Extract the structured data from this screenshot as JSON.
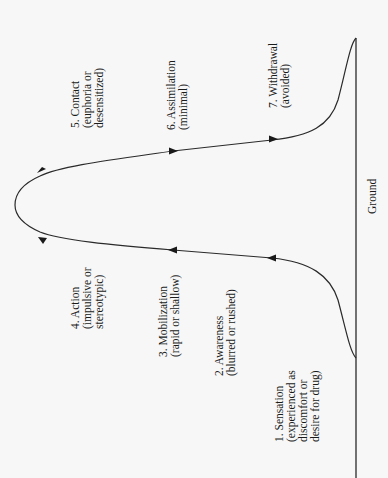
{
  "diagram": {
    "title": "",
    "ground_label": "Ground",
    "stages": [
      {
        "id": 1,
        "lines": [
          "1. Sensation",
          "(experienced as",
          "discomfort or",
          "desire for drug)"
        ]
      },
      {
        "id": 2,
        "lines": [
          "2. Awareness",
          "(blurred or rushed)"
        ]
      },
      {
        "id": 3,
        "lines": [
          "3. Mobilization",
          "(rapid or shallow)"
        ]
      },
      {
        "id": 4,
        "lines": [
          "4. Action",
          "(impulsive or",
          "stereotypic)"
        ]
      },
      {
        "id": 5,
        "lines": [
          "5. Contact",
          "(euphoria or",
          "desensitized)"
        ]
      },
      {
        "id": 6,
        "lines": [
          "6. Assimilation",
          "(minimal)"
        ]
      },
      {
        "id": 7,
        "lines": [
          "7. Withdrawal",
          "(avoided)"
        ]
      }
    ],
    "colors": {
      "background": "#f7f7f7",
      "line": "#2a2a2a",
      "text": "#1a1a1a"
    }
  }
}
